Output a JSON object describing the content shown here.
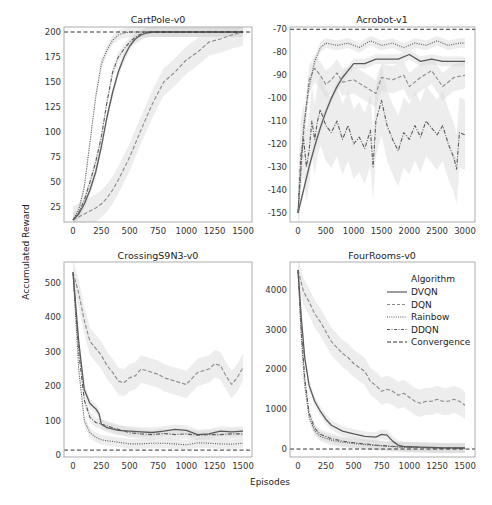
{
  "figure": {
    "ylabel": "Accumulated Reward",
    "xlabel": "Episodes"
  },
  "legend": {
    "title": "Algorithm",
    "entries": [
      {
        "label": "DVQN",
        "style": "solid"
      },
      {
        "label": "DQN",
        "style": "dashed"
      },
      {
        "label": "Rainbow",
        "style": "dotted"
      },
      {
        "label": "DDQN",
        "style": "dashdot"
      },
      {
        "label": "Convergence",
        "style": "convergence"
      }
    ]
  },
  "colors": {
    "line": "#5a5a5a",
    "dqn": "#8a8a8a",
    "band": "#d6d6d6",
    "convergence": "#333333",
    "frame": "#999999"
  },
  "chart_data": [
    {
      "type": "line",
      "title": "CartPole-v0",
      "xlabel": "Episodes",
      "ylabel": "Accumulated Reward",
      "xlim": [
        0,
        1500
      ],
      "ylim": [
        10,
        205
      ],
      "xticks": [
        "0",
        "250",
        "500",
        "750",
        "1000",
        "1250",
        "1500"
      ],
      "xtick_values": [
        0,
        250,
        500,
        750,
        1000,
        1250,
        1500
      ],
      "yticks": [
        "25",
        "50",
        "75",
        "100",
        "125",
        "150",
        "175",
        "200"
      ],
      "ytick_values": [
        25,
        50,
        75,
        100,
        125,
        150,
        175,
        200
      ],
      "convergence": 200,
      "grid": false,
      "series": [
        {
          "name": "DVQN",
          "x": [
            0,
            50,
            100,
            150,
            200,
            250,
            300,
            350,
            400,
            450,
            500,
            550,
            600,
            650,
            700,
            1500
          ],
          "y": [
            12,
            18,
            28,
            42,
            60,
            85,
            115,
            140,
            160,
            175,
            186,
            193,
            197,
            199,
            200,
            200
          ]
        },
        {
          "name": "DQN",
          "x": [
            0,
            100,
            200,
            250,
            300,
            350,
            400,
            500,
            600,
            700,
            800,
            900,
            1000,
            1100,
            1200,
            1300,
            1400,
            1500
          ],
          "y": [
            12,
            18,
            24,
            28,
            34,
            42,
            52,
            75,
            102,
            128,
            150,
            160,
            172,
            180,
            190,
            193,
            197,
            200
          ]
        },
        {
          "name": "Rainbow",
          "x": [
            0,
            50,
            100,
            150,
            200,
            250,
            300,
            350,
            400,
            450,
            500,
            1500
          ],
          "y": [
            12,
            22,
            45,
            90,
            135,
            168,
            182,
            192,
            197,
            199,
            200,
            200
          ]
        },
        {
          "name": "DDQN",
          "x": [
            0,
            50,
            100,
            150,
            200,
            250,
            300,
            350,
            400,
            450,
            500,
            550,
            600,
            650,
            1500
          ],
          "y": [
            12,
            19,
            32,
            50,
            70,
            95,
            130,
            160,
            175,
            183,
            190,
            195,
            198,
            200,
            200
          ]
        }
      ]
    },
    {
      "type": "line",
      "title": "Acrobot-v1",
      "xlabel": "Episodes",
      "ylabel": "Accumulated Reward",
      "xlim": [
        0,
        3000
      ],
      "ylim": [
        -154,
        -69
      ],
      "xticks": [
        "0",
        "500",
        "1000",
        "1500",
        "2000",
        "2500",
        "3000"
      ],
      "xtick_values": [
        0,
        500,
        1000,
        1500,
        2000,
        2500,
        3000
      ],
      "yticks": [
        "-150",
        "-140",
        "-130",
        "-120",
        "-110",
        "-100",
        "-90",
        "-80",
        "-70"
      ],
      "ytick_values": [
        -150,
        -140,
        -130,
        -120,
        -110,
        -100,
        -90,
        -80,
        -70
      ],
      "convergence": -70,
      "grid": false,
      "series": [
        {
          "name": "DVQN",
          "x": [
            0,
            100,
            200,
            300,
            400,
            500,
            600,
            700,
            800,
            900,
            1000,
            1200,
            1400,
            1600,
            1800,
            2000,
            2200,
            2400,
            2600,
            2800,
            3000
          ],
          "y": [
            -150,
            -140,
            -130,
            -121,
            -113,
            -106,
            -100,
            -95,
            -91,
            -88,
            -85,
            -85,
            -83,
            -83,
            -83,
            -81,
            -84,
            -83,
            -84,
            -84,
            -84
          ]
        },
        {
          "name": "DQN",
          "x": [
            0,
            100,
            200,
            300,
            400,
            500,
            600,
            700,
            800,
            1000,
            1200,
            1400,
            1500,
            1700,
            1900,
            2000,
            2200,
            2400,
            2600,
            2800,
            3000
          ],
          "y": [
            -150,
            -115,
            -92,
            -87,
            -90,
            -94,
            -92,
            -89,
            -93,
            -92,
            -95,
            -98,
            -91,
            -92,
            -90,
            -95,
            -91,
            -88,
            -95,
            -91,
            -90
          ]
        },
        {
          "name": "Rainbow",
          "x": [
            0,
            100,
            200,
            300,
            400,
            500,
            700,
            900,
            1100,
            1300,
            1500,
            1700,
            1900,
            2100,
            2300,
            2500,
            2700,
            2900,
            3000
          ],
          "y": [
            -150,
            -112,
            -95,
            -84,
            -78,
            -76,
            -77,
            -76,
            -78,
            -75,
            -77,
            -76,
            -78,
            -76,
            -77,
            -75,
            -77,
            -76,
            -76
          ]
        },
        {
          "name": "DDQN",
          "x": [
            0,
            50,
            100,
            150,
            200,
            250,
            300,
            350,
            400,
            500,
            600,
            700,
            800,
            900,
            1000,
            1100,
            1200,
            1300,
            1350,
            1400,
            1500,
            1600,
            1700,
            1800,
            1900,
            2000,
            2100,
            2200,
            2300,
            2400,
            2500,
            2600,
            2700,
            2800,
            2850,
            2900,
            3000
          ],
          "y": [
            -150,
            -125,
            -118,
            -130,
            -123,
            -110,
            -118,
            -110,
            -105,
            -112,
            -115,
            -110,
            -118,
            -112,
            -120,
            -117,
            -122,
            -114,
            -130,
            -110,
            -101,
            -112,
            -118,
            -123,
            -115,
            -118,
            -112,
            -117,
            -110,
            -113,
            -116,
            -112,
            -120,
            -126,
            -131,
            -115,
            -116
          ]
        }
      ]
    },
    {
      "type": "line",
      "title": "CrossingS9N3-v0",
      "xlabel": "Episodes",
      "ylabel": "Accumulated Reward",
      "xlim": [
        0,
        1500
      ],
      "ylim": [
        -5,
        560
      ],
      "xticks": [
        "0",
        "250",
        "500",
        "750",
        "1000",
        "1250",
        "1500"
      ],
      "xtick_values": [
        0,
        250,
        500,
        750,
        1000,
        1250,
        1500
      ],
      "yticks": [
        "0",
        "100",
        "200",
        "300",
        "400",
        "500"
      ],
      "ytick_values": [
        0,
        100,
        200,
        300,
        400,
        500
      ],
      "convergence": 15,
      "grid": false,
      "series": [
        {
          "name": "DVQN",
          "x": [
            0,
            50,
            100,
            150,
            200,
            230,
            250,
            300,
            400,
            500,
            600,
            700,
            800,
            900,
            1000,
            1100,
            1200,
            1300,
            1400,
            1500
          ],
          "y": [
            530,
            330,
            190,
            150,
            135,
            120,
            90,
            80,
            72,
            70,
            68,
            66,
            70,
            75,
            72,
            60,
            62,
            70,
            68,
            70
          ]
        },
        {
          "name": "DQN",
          "x": [
            0,
            50,
            100,
            150,
            200,
            250,
            300,
            350,
            400,
            450,
            500,
            550,
            600,
            700,
            750,
            800,
            900,
            1000,
            1100,
            1200,
            1250,
            1300,
            1350,
            1400,
            1450,
            1500
          ],
          "y": [
            530,
            470,
            390,
            330,
            310,
            290,
            260,
            240,
            215,
            210,
            225,
            230,
            250,
            240,
            235,
            225,
            215,
            205,
            240,
            250,
            265,
            260,
            230,
            205,
            225,
            255
          ]
        },
        {
          "name": "Rainbow",
          "x": [
            0,
            50,
            100,
            150,
            200,
            250,
            300,
            400,
            500,
            600,
            700,
            800,
            900,
            1000,
            1100,
            1200,
            1300,
            1400,
            1500
          ],
          "y": [
            530,
            250,
            100,
            65,
            52,
            45,
            42,
            38,
            33,
            33,
            35,
            35,
            33,
            30,
            36,
            35,
            33,
            32,
            35
          ]
        },
        {
          "name": "DDQN",
          "x": [
            0,
            50,
            100,
            150,
            200,
            250,
            300,
            400,
            500,
            600,
            700,
            800,
            900,
            1000,
            1100,
            1200,
            1300,
            1400,
            1500
          ],
          "y": [
            530,
            300,
            160,
            110,
            95,
            90,
            85,
            75,
            65,
            62,
            60,
            63,
            60,
            62,
            58,
            60,
            60,
            62,
            62
          ]
        }
      ]
    },
    {
      "type": "line",
      "title": "FourRooms-v0",
      "xlabel": "Episodes",
      "ylabel": "Accumulated Reward",
      "xlim": [
        0,
        1500
      ],
      "ylim": [
        -200,
        4700
      ],
      "xticks": [
        "0",
        "250",
        "500",
        "750",
        "1000",
        "1250",
        "1500"
      ],
      "xtick_values": [
        0,
        250,
        500,
        750,
        1000,
        1250,
        1500
      ],
      "yticks": [
        "0",
        "1000",
        "2000",
        "3000",
        "4000"
      ],
      "ytick_values": [
        0,
        1000,
        2000,
        3000,
        4000
      ],
      "convergence": 0,
      "grid": false,
      "legend_position": "upper right",
      "series": [
        {
          "name": "DVQN",
          "x": [
            0,
            30,
            60,
            100,
            150,
            200,
            250,
            300,
            400,
            500,
            600,
            700,
            750,
            800,
            850,
            900,
            950,
            1000,
            1100,
            1200,
            1300,
            1500
          ],
          "y": [
            4500,
            3300,
            2300,
            1600,
            1200,
            950,
            750,
            600,
            450,
            380,
            320,
            300,
            370,
            350,
            200,
            100,
            60,
            60,
            50,
            40,
            30,
            30
          ]
        },
        {
          "name": "DQN",
          "x": [
            0,
            50,
            100,
            150,
            200,
            250,
            300,
            350,
            400,
            450,
            500,
            550,
            600,
            650,
            700,
            750,
            800,
            850,
            900,
            950,
            1000,
            1050,
            1100,
            1150,
            1200,
            1250,
            1300,
            1350,
            1400,
            1450,
            1500
          ],
          "y": [
            4500,
            3950,
            3700,
            3400,
            3200,
            2950,
            2700,
            2550,
            2400,
            2300,
            2150,
            2050,
            1950,
            1700,
            1600,
            1450,
            1500,
            1450,
            1350,
            1400,
            1300,
            1200,
            1150,
            1200,
            1200,
            1250,
            1200,
            1200,
            1250,
            1200,
            1100
          ]
        },
        {
          "name": "Rainbow",
          "x": [
            0,
            30,
            60,
            100,
            150,
            200,
            300,
            400,
            500,
            600,
            700,
            800,
            900,
            1000,
            1200,
            1500
          ],
          "y": [
            4500,
            2800,
            1600,
            800,
            450,
            320,
            220,
            170,
            140,
            110,
            90,
            70,
            55,
            45,
            30,
            20
          ]
        },
        {
          "name": "DDQN",
          "x": [
            0,
            30,
            60,
            100,
            150,
            200,
            300,
            400,
            500,
            600,
            700,
            800,
            900,
            1000,
            1200,
            1500
          ],
          "y": [
            4500,
            3000,
            1800,
            900,
            520,
            370,
            260,
            200,
            160,
            130,
            100,
            80,
            60,
            50,
            30,
            20
          ]
        }
      ]
    }
  ]
}
